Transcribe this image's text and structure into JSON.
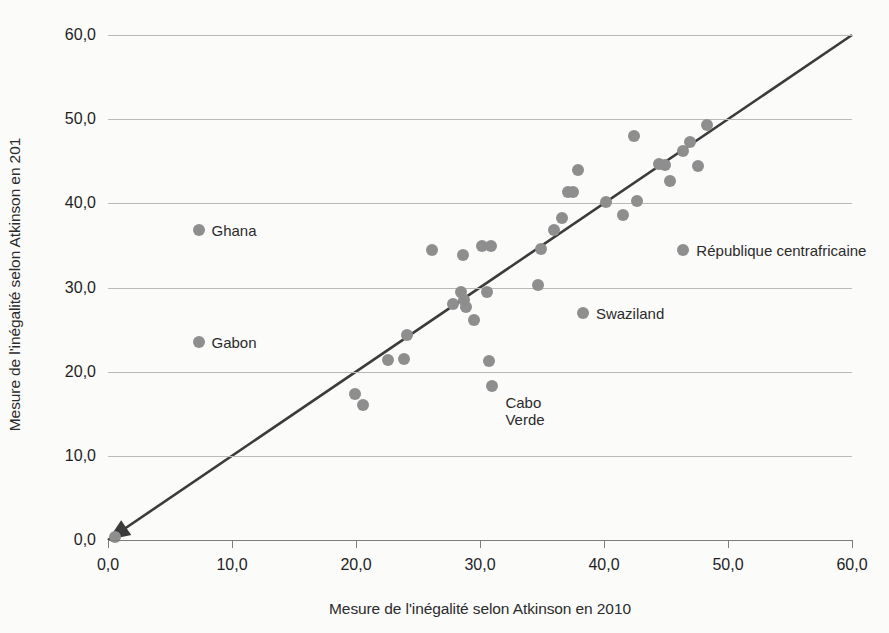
{
  "chart_data": {
    "type": "scatter",
    "title": "",
    "xlabel": "Mesure de l'inégalité selon Atkinson en 2010",
    "ylabel": "Mesure de l'inégalité selon Atkinson en 201",
    "xlim": [
      0,
      60
    ],
    "ylim": [
      0,
      60
    ],
    "xticks": [
      "0,0",
      "10,0",
      "20,0",
      "30,0",
      "40,0",
      "50,0",
      "60,0"
    ],
    "yticks": [
      "0,0",
      "10,0",
      "20,0",
      "30,0",
      "40,0",
      "50,0",
      "60,0"
    ],
    "xtick_values": [
      0,
      10,
      20,
      30,
      40,
      50,
      60
    ],
    "ytick_values": [
      0,
      10,
      20,
      30,
      40,
      50,
      60
    ],
    "grid": "horizontal",
    "legend": "none",
    "series_name": "Pays africains",
    "point_color": "#8e8e8e",
    "reference_line": {
      "name": "ligne 45 degres",
      "from": [
        0,
        0
      ],
      "to": [
        60,
        60
      ],
      "color": "#3b3b3b",
      "arrow_at": "origin"
    },
    "points": [
      {
        "x": 0.6,
        "y": 0.4,
        "label": ""
      },
      {
        "x": 7.3,
        "y": 36.8,
        "label": "Ghana"
      },
      {
        "x": 7.3,
        "y": 23.5,
        "label": "Gabon"
      },
      {
        "x": 19.9,
        "y": 17.4,
        "label": ""
      },
      {
        "x": 20.6,
        "y": 16.0,
        "label": ""
      },
      {
        "x": 22.6,
        "y": 21.4,
        "label": ""
      },
      {
        "x": 23.9,
        "y": 21.5,
        "label": ""
      },
      {
        "x": 24.1,
        "y": 24.3,
        "label": ""
      },
      {
        "x": 26.1,
        "y": 34.5,
        "label": ""
      },
      {
        "x": 27.8,
        "y": 28.0,
        "label": ""
      },
      {
        "x": 28.5,
        "y": 29.5,
        "label": ""
      },
      {
        "x": 28.7,
        "y": 28.5,
        "label": ""
      },
      {
        "x": 28.9,
        "y": 27.7,
        "label": ""
      },
      {
        "x": 28.6,
        "y": 33.9,
        "label": ""
      },
      {
        "x": 29.5,
        "y": 26.1,
        "label": ""
      },
      {
        "x": 30.2,
        "y": 34.9,
        "label": ""
      },
      {
        "x": 30.9,
        "y": 34.9,
        "label": ""
      },
      {
        "x": 30.6,
        "y": 29.5,
        "label": ""
      },
      {
        "x": 30.7,
        "y": 21.3,
        "label": ""
      },
      {
        "x": 31.0,
        "y": 18.3,
        "label": "Cabo\nVerde"
      },
      {
        "x": 34.7,
        "y": 30.3,
        "label": ""
      },
      {
        "x": 34.9,
        "y": 34.6,
        "label": ""
      },
      {
        "x": 36.0,
        "y": 36.8,
        "label": ""
      },
      {
        "x": 36.6,
        "y": 38.3,
        "label": ""
      },
      {
        "x": 37.1,
        "y": 41.3,
        "label": ""
      },
      {
        "x": 37.5,
        "y": 41.4,
        "label": ""
      },
      {
        "x": 37.9,
        "y": 44.0,
        "label": ""
      },
      {
        "x": 38.3,
        "y": 27.0,
        "label": "Swaziland"
      },
      {
        "x": 40.2,
        "y": 40.1,
        "label": ""
      },
      {
        "x": 41.5,
        "y": 38.6,
        "label": ""
      },
      {
        "x": 42.4,
        "y": 48.0,
        "label": ""
      },
      {
        "x": 42.7,
        "y": 40.3,
        "label": ""
      },
      {
        "x": 44.4,
        "y": 44.7,
        "label": ""
      },
      {
        "x": 44.9,
        "y": 44.5,
        "label": ""
      },
      {
        "x": 45.3,
        "y": 42.7,
        "label": ""
      },
      {
        "x": 46.4,
        "y": 46.2,
        "label": ""
      },
      {
        "x": 46.9,
        "y": 47.3,
        "label": ""
      },
      {
        "x": 47.6,
        "y": 44.4,
        "label": ""
      },
      {
        "x": 48.3,
        "y": 49.3,
        "label": ""
      },
      {
        "x": 46.4,
        "y": 34.4,
        "label": "République centrafricaine"
      }
    ],
    "annotations": [
      {
        "text": "Ghana",
        "x": 7.3,
        "y": 36.8
      },
      {
        "text": "Gabon",
        "x": 7.3,
        "y": 23.5
      },
      {
        "text": "Cabo\nVerde",
        "x": 31.0,
        "y": 18.3
      },
      {
        "text": "Swaziland",
        "x": 38.3,
        "y": 27.0
      },
      {
        "text": "République centrafricaine",
        "x": 46.4,
        "y": 34.4
      }
    ]
  }
}
